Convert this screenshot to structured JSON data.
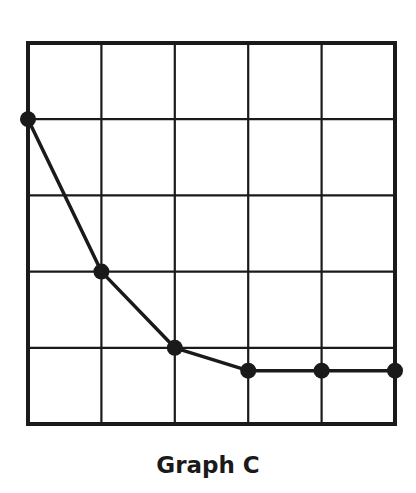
{
  "chart_data": {
    "type": "line",
    "title": "Graph C",
    "xlabel": "",
    "ylabel": "",
    "x": [
      0,
      1,
      2,
      3,
      4,
      5
    ],
    "values": [
      4,
      2,
      1,
      0.7,
      0.7,
      0.7
    ],
    "xlim": [
      0,
      5
    ],
    "ylim": [
      0,
      5
    ],
    "grid": true,
    "grid_columns": 5,
    "grid_rows": 5,
    "markers": true,
    "legend": null
  },
  "colors": {
    "line": "#1a1a1a",
    "grid": "#1a1a1a",
    "background": "#ffffff"
  }
}
